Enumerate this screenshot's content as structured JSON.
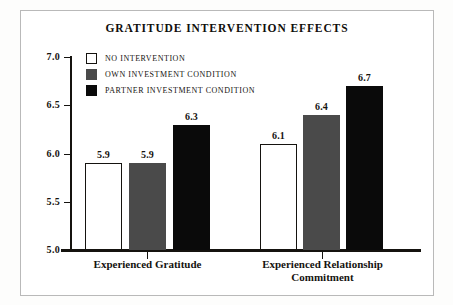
{
  "chart_data": {
    "type": "bar",
    "title": "GRATITUDE INTERVENTION EFFECTS",
    "xlabel": "",
    "ylabel": "",
    "ylim": [
      5.0,
      7.0
    ],
    "grid": false,
    "legend_position": "top-left",
    "categories": [
      "Experienced Gratitude",
      "Experienced Relationship Commitment"
    ],
    "yticks": [
      "7.0",
      "6.5",
      "6.0",
      "5.5",
      "5.0"
    ],
    "ytick_values": [
      7.0,
      6.5,
      6.0,
      5.5,
      5.0
    ],
    "series": [
      {
        "name": "NO INTERVENTION",
        "color": "#ffffff",
        "values": [
          5.9,
          6.1
        ],
        "labels": [
          "5.9",
          "6.1"
        ]
      },
      {
        "name": "OWN INVESTMENT CONDITION",
        "color": "#4a4a4a",
        "values": [
          5.9,
          6.4
        ],
        "labels": [
          "5.9",
          "6.4"
        ]
      },
      {
        "name": "PARTNER INVESTMENT CONDITION",
        "color": "#0a0a0a",
        "values": [
          6.3,
          6.7
        ],
        "labels": [
          "6.3",
          "6.7"
        ]
      }
    ]
  },
  "colors": {
    "axis": "#15130f",
    "frame": "#b9b9b9",
    "background": "#ffffff",
    "series_white": "#ffffff",
    "series_gray": "#4a4a4a",
    "series_black": "#0a0a0a"
  }
}
